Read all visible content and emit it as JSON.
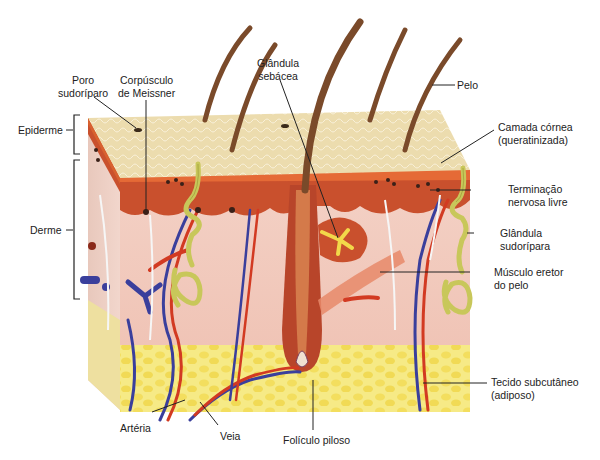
{
  "diagram": {
    "language": "pt",
    "colors": {
      "epidermis_surface": "#ecdcae",
      "epidermis_edge": "#d8612f",
      "dermis_papillary": "#c9502d",
      "dermis": "#f0c8bc",
      "subcutaneous": "#f5e77a",
      "fat_lobules": "#f2dc5a",
      "artery": "#d23a22",
      "vein": "#3a3f9c",
      "sweat_gland": "#c8c75a",
      "hair": "#7a4a2a",
      "nerve": "#f4f4f4"
    },
    "labels": {
      "poro_sudoriparo": [
        "Poro",
        "sudoríparo"
      ],
      "corpusculo_meissner": [
        "Corpúsculo",
        "de Meissner"
      ],
      "glandula_sebacea": [
        "Glândula",
        "sebácea"
      ],
      "pelo": "Pelo",
      "epiderme": "Epiderme",
      "derme": "Derme",
      "camada_cornea": [
        "Camada córnea",
        "(queratinizada)"
      ],
      "terminacao_nervosa": [
        "Terminação",
        "nervosa livre"
      ],
      "glandula_sudoripara": [
        "Glândula",
        "sudorípara"
      ],
      "musculo_eretor": [
        "Músculo eretor",
        "do pelo"
      ],
      "tecido_subcutaneo": [
        "Tecido subcutâneo",
        "(adiposo)"
      ],
      "arteria": "Artéria",
      "veia": "Veia",
      "foliculo_piloso": "Folículo piloso"
    }
  }
}
